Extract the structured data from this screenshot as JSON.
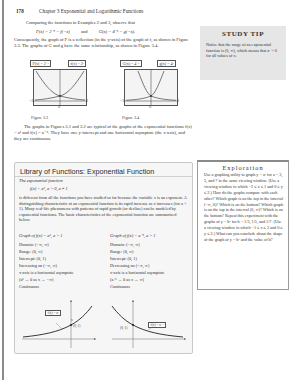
{
  "header": {
    "page_number": "178",
    "chapter": "Chapter 3   Exponential and Logarithmic Functions"
  },
  "intro": {
    "line1": "Comparing the functions in Examples 2 and 3, observe that",
    "eq_F": "F(x) = 2⁻ˣ = f(−x)",
    "eq_and": "and",
    "eq_G": "G(x) = 4⁻ˣ = g(−x).",
    "paragraph": "Consequently, the graph of F is a reflection (in the y-axis) of the graph of f, as shown in Figure 3.3. The graphs of G and g have the same relationship, as shown in Figure 3.4."
  },
  "study_tip": {
    "title": "STUDY TIP",
    "text": "Notice that the range of an exponential function is (0, ∞), which means that aˣ > 0 for all values of x."
  },
  "figures": [
    {
      "caption": "Figure 3.3",
      "label_left": "F(x) = 2⁻ˣ",
      "label_right": "f(x) = 2ˣ",
      "tick_left": "−3",
      "tick_right": "3",
      "tick_bottom": "0"
    },
    {
      "caption": "Figure 3.4",
      "label_left": "G(x) = 4⁻ˣ",
      "label_right": "g(x) = 4ˣ",
      "tick_left": "−3",
      "tick_right": "3",
      "tick_bottom": "0"
    }
  ],
  "after_figures": "The graphs in Figures 3.1 and 3.2 are typical of the graphs of the exponential functions f(x) = aˣ and f(x) = a⁻ˣ. They have one y-intercept and one horizontal asymptote (the x-axis), and they are continuous.",
  "library": {
    "title": "Library of Functions: Exponential Function",
    "subtitle": "The exponential function",
    "equation": "f(x) = aˣ, a > 0, a ≠ 1",
    "paragraph": "is different from all the functions you have studied so far because the variable x is an exponent. A distinguishing characteristic of an exponential function is its rapid increase as x increases (for a > 1). Many real-life phenomena with patterns of rapid growth (or decline) can be modeled by exponential functions. The basic characteristics of the exponential function are summarized below.",
    "left_col": {
      "heading": "Graph of f(x) = aˣ, a > 1",
      "items": [
        "Domain: (−∞, ∞)",
        "Range: (0, ∞)",
        "Intercept: (0, 1)",
        "Increasing on (−∞, ∞)",
        "x-axis is a horizontal asymptote",
        "(aˣ → 0 as x → −∞)",
        "Continuous"
      ],
      "graph_label": "f(x) = aˣ",
      "point_label": "(0, 1)",
      "axis_x": "x",
      "axis_y": "y"
    },
    "right_col": {
      "heading": "Graph of f(x) = a⁻ˣ, a > 1",
      "items": [
        "Domain: (−∞, ∞)",
        "Range: (0, ∞)",
        "Intercept: (0, 1)",
        "Decreasing on (−∞, ∞)",
        "x-axis is a horizontal asymptote",
        "(a⁻ˣ → 0 as x → ∞)",
        "Continuous"
      ],
      "graph_label": "f(x) = a⁻ˣ",
      "point_label": "(0, 1)",
      "axis_x": "x",
      "axis_y": "y"
    }
  },
  "exploration": {
    "title": "Exploration",
    "text": "Use a graphing utility to graph y = aˣ for a = 3, 5, and 7 in the same viewing window. (Use a viewing window in which −2 ≤ x ≤ 1 and 0 ≤ y ≤ 2.) How do the graphs compare with each other? Which graph is on the top in the interval (−∞, 0)? Which is on the bottom? Which graph is on the top in the interval (0, ∞)? Which is on the bottom? Repeat this experiment with the graphs of y = bˣ for b = 1/3, 1/5, and 1/7. (Use a viewing window in which −1 ≤ x ≤ 2 and 0 ≤ y ≤ 2.) What can you conclude about the shape of the graph of y = bˣ and the value of b?"
  }
}
